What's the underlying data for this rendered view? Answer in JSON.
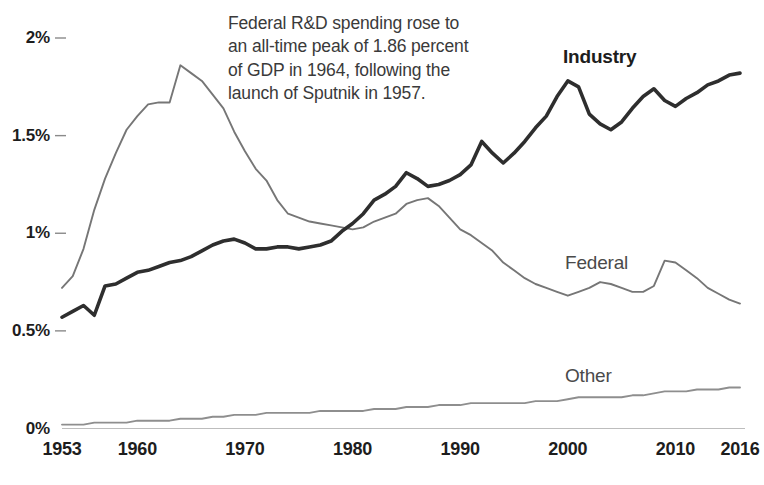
{
  "chart_data": {
    "type": "line",
    "title": "",
    "subtitle": "",
    "xlabel": "",
    "ylabel": "",
    "xlim": [
      1953,
      2016
    ],
    "ylim": [
      0,
      2.05
    ],
    "grid": false,
    "legend_position": "inline-series-labels",
    "y_tick_labels": [
      "2%",
      "1.5%",
      "1%",
      "0.5%",
      "0%"
    ],
    "y_tick_values": [
      2,
      1.5,
      1,
      0.5,
      0
    ],
    "x_tick_labels": [
      "1953",
      "1960",
      "1970",
      "1980",
      "1990",
      "2000",
      "2010",
      "2016"
    ],
    "x_tick_values": [
      1953,
      1960,
      1970,
      1980,
      1990,
      2000,
      2010,
      2016
    ],
    "annotation": {
      "lines": [
        "Federal R&D spending rose to",
        "an all-time peak of 1.86 percent",
        "of GDP in 1964, following the",
        "launch of Sputnik in 1957."
      ]
    },
    "x": [
      1953,
      1954,
      1955,
      1956,
      1957,
      1958,
      1959,
      1960,
      1961,
      1962,
      1963,
      1964,
      1965,
      1966,
      1967,
      1968,
      1969,
      1970,
      1971,
      1972,
      1973,
      1974,
      1975,
      1976,
      1977,
      1978,
      1979,
      1980,
      1981,
      1982,
      1983,
      1984,
      1985,
      1986,
      1987,
      1988,
      1989,
      1990,
      1991,
      1992,
      1993,
      1994,
      1995,
      1996,
      1997,
      1998,
      1999,
      2000,
      2001,
      2002,
      2003,
      2004,
      2005,
      2006,
      2007,
      2008,
      2009,
      2010,
      2011,
      2012,
      2013,
      2014,
      2015,
      2016
    ],
    "series": [
      {
        "name": "Industry",
        "color": "#2e2e2e",
        "width": 3.6,
        "label_x": 2000,
        "values": [
          0.57,
          0.6,
          0.63,
          0.58,
          0.73,
          0.74,
          0.77,
          0.8,
          0.81,
          0.83,
          0.85,
          0.86,
          0.88,
          0.91,
          0.94,
          0.96,
          0.97,
          0.95,
          0.92,
          0.92,
          0.93,
          0.93,
          0.92,
          0.93,
          0.94,
          0.96,
          1.01,
          1.05,
          1.1,
          1.17,
          1.2,
          1.24,
          1.31,
          1.28,
          1.24,
          1.25,
          1.27,
          1.3,
          1.35,
          1.47,
          1.41,
          1.36,
          1.41,
          1.47,
          1.54,
          1.6,
          1.7,
          1.78,
          1.75,
          1.61,
          1.56,
          1.53,
          1.57,
          1.64,
          1.7,
          1.74,
          1.68,
          1.65,
          1.69,
          1.72,
          1.76,
          1.78,
          1.81,
          1.82
        ]
      },
      {
        "name": "Federal",
        "color": "#767676",
        "width": 1.9,
        "label_x": 2004,
        "values": [
          0.72,
          0.78,
          0.92,
          1.12,
          1.28,
          1.41,
          1.53,
          1.6,
          1.66,
          1.67,
          1.67,
          1.86,
          1.82,
          1.78,
          1.71,
          1.64,
          1.52,
          1.42,
          1.33,
          1.27,
          1.17,
          1.1,
          1.08,
          1.06,
          1.05,
          1.04,
          1.03,
          1.02,
          1.03,
          1.06,
          1.08,
          1.1,
          1.15,
          1.17,
          1.18,
          1.14,
          1.08,
          1.02,
          0.99,
          0.95,
          0.91,
          0.85,
          0.81,
          0.77,
          0.74,
          0.72,
          0.7,
          0.68,
          0.7,
          0.72,
          0.75,
          0.74,
          0.72,
          0.7,
          0.7,
          0.73,
          0.86,
          0.85,
          0.81,
          0.77,
          0.72,
          0.69,
          0.66,
          0.64
        ]
      },
      {
        "name": "Other",
        "color": "#8e8e8e",
        "width": 1.9,
        "label_x": 2004,
        "values": [
          0.02,
          0.02,
          0.02,
          0.03,
          0.03,
          0.03,
          0.03,
          0.04,
          0.04,
          0.04,
          0.04,
          0.05,
          0.05,
          0.05,
          0.06,
          0.06,
          0.07,
          0.07,
          0.07,
          0.08,
          0.08,
          0.08,
          0.08,
          0.08,
          0.09,
          0.09,
          0.09,
          0.09,
          0.09,
          0.1,
          0.1,
          0.1,
          0.11,
          0.11,
          0.11,
          0.12,
          0.12,
          0.12,
          0.13,
          0.13,
          0.13,
          0.13,
          0.13,
          0.13,
          0.14,
          0.14,
          0.14,
          0.15,
          0.16,
          0.16,
          0.16,
          0.16,
          0.16,
          0.17,
          0.17,
          0.18,
          0.19,
          0.19,
          0.19,
          0.2,
          0.2,
          0.2,
          0.21,
          0.21
        ]
      }
    ],
    "axis_line_color": "#b4b4b4",
    "tick_mark_color": "#8a8a8a"
  }
}
